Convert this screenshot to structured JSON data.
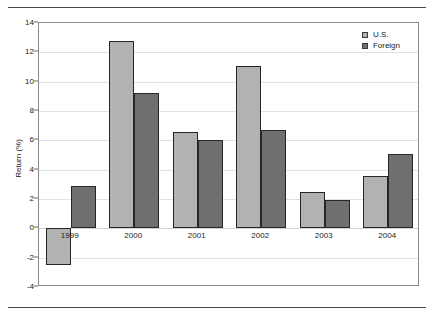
{
  "chart_data": {
    "type": "bar",
    "title": "",
    "xlabel": "",
    "ylabel": "Return (%)",
    "categories": [
      "1999",
      "2000",
      "2001",
      "2002",
      "2003",
      "2004"
    ],
    "series": [
      {
        "name": "U.S.",
        "color": "#b2b2b2",
        "values": [
          -2.5,
          12.8,
          6.6,
          11.1,
          2.5,
          3.6
        ]
      },
      {
        "name": "Foreign",
        "color": "#6f6f6f",
        "values": [
          2.9,
          9.2,
          6.0,
          6.7,
          1.9,
          5.1
        ]
      }
    ],
    "ylim": [
      -4,
      14
    ],
    "yticks": [
      -4,
      -2,
      0,
      2,
      4,
      6,
      8,
      10,
      12,
      14
    ],
    "ytick_labels": [
      "-4",
      "-2",
      "0",
      "2",
      "4",
      "6",
      "8",
      "10",
      "12",
      "14"
    ],
    "grid": true,
    "legend_position": "top-right"
  },
  "legend": {
    "entries": [
      {
        "label": "U.S.",
        "swatch": "legend-swatch-us"
      },
      {
        "label": "Foreign",
        "swatch": "legend-swatch-foreign"
      }
    ]
  }
}
